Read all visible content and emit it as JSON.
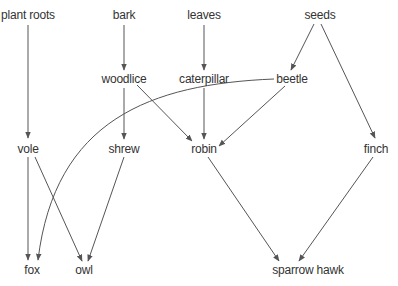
{
  "diagram": {
    "type": "food-web",
    "nodes": [
      {
        "id": "plant_roots",
        "label": "plant roots",
        "x": 28,
        "y": 15
      },
      {
        "id": "bark",
        "label": "bark",
        "x": 124,
        "y": 15
      },
      {
        "id": "leaves",
        "label": "leaves",
        "x": 204,
        "y": 15
      },
      {
        "id": "seeds",
        "label": "seeds",
        "x": 320,
        "y": 15
      },
      {
        "id": "woodlice",
        "label": "woodlice",
        "x": 124,
        "y": 79
      },
      {
        "id": "caterpillar",
        "label": "caterpillar",
        "x": 204,
        "y": 79
      },
      {
        "id": "beetle",
        "label": "beetle",
        "x": 292,
        "y": 79
      },
      {
        "id": "vole",
        "label": "vole",
        "x": 28,
        "y": 149
      },
      {
        "id": "shrew",
        "label": "shrew",
        "x": 124,
        "y": 149
      },
      {
        "id": "robin",
        "label": "robin",
        "x": 204,
        "y": 149
      },
      {
        "id": "finch",
        "label": "finch",
        "x": 376,
        "y": 149
      },
      {
        "id": "fox",
        "label": "fox",
        "x": 32,
        "y": 270
      },
      {
        "id": "owl",
        "label": "owl",
        "x": 84,
        "y": 270
      },
      {
        "id": "sparrow_hawk",
        "label": "sparrow hawk",
        "x": 308,
        "y": 270
      }
    ],
    "edges": [
      {
        "from": "plant_roots",
        "to": "vole"
      },
      {
        "from": "bark",
        "to": "woodlice"
      },
      {
        "from": "leaves",
        "to": "caterpillar"
      },
      {
        "from": "seeds",
        "to": "beetle"
      },
      {
        "from": "seeds",
        "to": "finch"
      },
      {
        "from": "woodlice",
        "to": "shrew"
      },
      {
        "from": "woodlice",
        "to": "robin"
      },
      {
        "from": "caterpillar",
        "to": "robin"
      },
      {
        "from": "beetle",
        "to": "robin"
      },
      {
        "from": "beetle",
        "to": "fox",
        "curved": true
      },
      {
        "from": "vole",
        "to": "fox"
      },
      {
        "from": "vole",
        "to": "owl"
      },
      {
        "from": "shrew",
        "to": "owl"
      },
      {
        "from": "robin",
        "to": "sparrow_hawk"
      },
      {
        "from": "finch",
        "to": "sparrow_hawk"
      }
    ],
    "colors": {
      "line": "#555555",
      "text": "#333333",
      "background": "#ffffff"
    }
  }
}
